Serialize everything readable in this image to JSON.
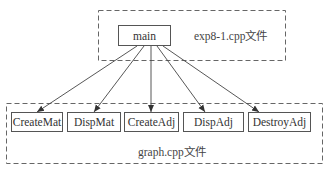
{
  "diagram": {
    "top_group": {
      "label": "exp8-1.cpp文件",
      "root": "main"
    },
    "bottom_group": {
      "label": "graph.cpp文件",
      "functions": [
        "CreateMat",
        "DispMat",
        "CreateAdj",
        "DispAdj",
        "DestroyAdj"
      ]
    },
    "edges": [
      {
        "from": "main",
        "to": "CreateMat"
      },
      {
        "from": "main",
        "to": "DispMat"
      },
      {
        "from": "main",
        "to": "CreateAdj"
      },
      {
        "from": "main",
        "to": "DispAdj"
      },
      {
        "from": "main",
        "to": "DestroyAdj"
      }
    ]
  }
}
